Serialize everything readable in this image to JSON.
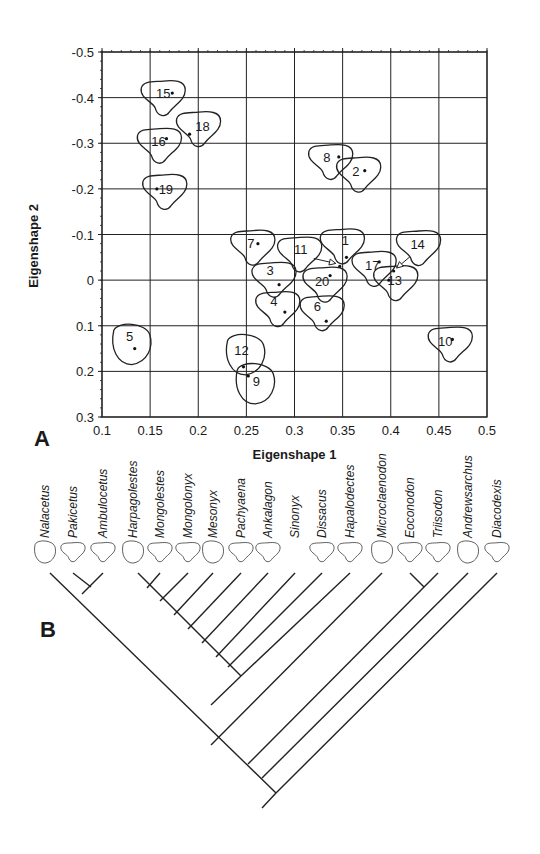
{
  "figure": {
    "panel_a_label": "A",
    "panel_b_label": "B"
  },
  "chart_data": [
    {
      "type": "scatter",
      "panel": "A",
      "title": "",
      "xlabel": "Eigenshape 1",
      "ylabel": "Eigenshape 2",
      "xlim": [
        0.1,
        0.5
      ],
      "ylim": [
        -0.5,
        0.3
      ],
      "y_axis_inverted": true,
      "grid": true,
      "x_ticks": [
        "0.1",
        "0.15",
        "0.2",
        "0.25",
        "0.3",
        "0.35",
        "0.4",
        "0.45",
        "0.5"
      ],
      "y_ticks": [
        "-0.5",
        "-0.4",
        "-0.3",
        "-0.2",
        "-0.1",
        "0",
        "0.1",
        "0.2",
        "0.3"
      ],
      "points": [
        {
          "label": "1",
          "x": 0.354,
          "y": -0.05
        },
        {
          "label": "2",
          "x": 0.373,
          "y": -0.24
        },
        {
          "label": "3",
          "x": 0.284,
          "y": 0.01
        },
        {
          "label": "4",
          "x": 0.29,
          "y": 0.07
        },
        {
          "label": "5",
          "x": 0.134,
          "y": 0.15
        },
        {
          "label": "6",
          "x": 0.333,
          "y": 0.09
        },
        {
          "label": "7",
          "x": 0.262,
          "y": -0.08
        },
        {
          "label": "8",
          "x": 0.346,
          "y": -0.27
        },
        {
          "label": "9",
          "x": 0.252,
          "y": 0.21
        },
        {
          "label": "10",
          "x": 0.464,
          "y": 0.13
        },
        {
          "label": "11",
          "x": 0.347,
          "y": -0.03
        },
        {
          "label": "12",
          "x": 0.247,
          "y": 0.19
        },
        {
          "label": "13",
          "x": 0.398,
          "y": 0.0
        },
        {
          "label": "14",
          "x": 0.403,
          "y": -0.02
        },
        {
          "label": "15",
          "x": 0.173,
          "y": -0.41
        },
        {
          "label": "16",
          "x": 0.167,
          "y": -0.31
        },
        {
          "label": "17",
          "x": 0.388,
          "y": -0.04
        },
        {
          "label": "18",
          "x": 0.191,
          "y": -0.32
        },
        {
          "label": "19",
          "x": 0.157,
          "y": -0.2
        },
        {
          "label": "20",
          "x": 0.337,
          "y": -0.01
        }
      ],
      "annotations": [
        "Each point drawn with a tooth-outline shape; points 11 and 14 indicated by arrows"
      ]
    },
    {
      "type": "cladogram",
      "panel": "B",
      "taxa": [
        "Nalacetus",
        "Pakicetus",
        "Ambulocetus",
        "Harpagolestes",
        "Mongolestes",
        "Mongolonyx",
        "Mesonyx",
        "Pachyaena",
        "Ankalagon",
        "Sinonyx",
        "Dissacus",
        "Hapalodectes",
        "Microclaenodon",
        "Eoconodon",
        "Triisodon",
        "Andrewsarchus",
        "Diacodexis"
      ],
      "topology": "(Diacodexis,(Andrewsarchus,((Eoconodon,Triisodon),(Microclaenodon,(Hapalodectes,(Dissacus,(Sinonyx,(Ankalagon,(Pachyaena,(Mesonyx,(Mongolonyx,(Mongolestes,Harpagolestes)))))))),(Nalacetus,(Pakicetus,Ambulocetus)))))))"
    }
  ]
}
